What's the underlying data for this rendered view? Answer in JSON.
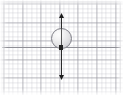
{
  "figure": {
    "background_color": "#ffffff",
    "width": 123,
    "height": 95
  },
  "grid": {
    "name": "graph-paper-grid",
    "major_spacing_px": 18.6,
    "minor_spacing_px": 4.65,
    "major_color": "#969699",
    "minor_color": "#b2b2bc",
    "visible": true
  },
  "axes": {
    "horizontal": {
      "label": "",
      "color": "#8f8f96",
      "y_px": 47,
      "visible": true
    },
    "vertical_vector": {
      "label": "",
      "color": "#2b2b2b",
      "x_px": 61,
      "top_px": 14,
      "bottom_px": 80,
      "arrowheads": "both",
      "visible": true
    }
  },
  "objects": [
    {
      "name": "sphere",
      "shape": "circle",
      "center_x_px": 61,
      "center_y_px": 38,
      "diameter_px": 21,
      "fill": "#e2e2e4",
      "highlight": "#fdfdfd",
      "stroke": "#7e7e86"
    }
  ],
  "chart_data": {
    "type": "scatter",
    "title": "",
    "xlabel": "",
    "ylabel": "",
    "grid": true,
    "legend": null,
    "annotations": [
      {
        "type": "circle-marker",
        "x": 0,
        "y": 0.5,
        "radius": 0.55,
        "label": ""
      },
      {
        "type": "double-arrow",
        "x": 0,
        "y_start": -1.75,
        "y_end": 1.75,
        "label": ""
      },
      {
        "type": "horizontal-line",
        "y": 0,
        "label": ""
      }
    ]
  }
}
